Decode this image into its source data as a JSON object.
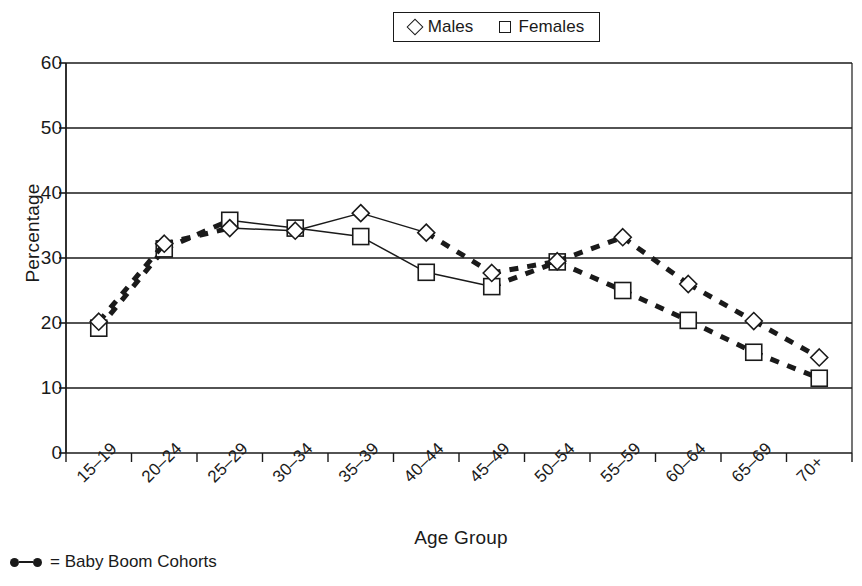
{
  "top_partial_text": "",
  "legend": {
    "position": "top-center",
    "entries": [
      {
        "marker": "diamond-icon",
        "label": "Males"
      },
      {
        "marker": "square-icon",
        "label": "Females"
      }
    ]
  },
  "footnote": {
    "marker": "baby-boom-line-icon",
    "text": "= Baby Boom Cohorts"
  },
  "axis": {
    "ylabel": "Percentage",
    "xlabel": "Age Group"
  },
  "chart_data": {
    "type": "line",
    "title": "",
    "xlabel": "Age Group",
    "ylabel": "Percentage",
    "ylim": [
      0,
      60
    ],
    "ytick_labels": [
      "0",
      "10",
      "20",
      "30",
      "40",
      "50",
      "60"
    ],
    "yticks": [
      0,
      10,
      20,
      30,
      40,
      50,
      60
    ],
    "grid": "horizontal",
    "legend": "top-center",
    "categories": [
      "15–19",
      "20–24",
      "25–29",
      "30–34",
      "35–39",
      "40–44",
      "45–49",
      "50–54",
      "55–59",
      "60–64",
      "65–69",
      "70+"
    ],
    "series": [
      {
        "name": "Males",
        "marker": "diamond",
        "values": [
          20.2,
          32.2,
          34.6,
          34.2,
          36.9,
          33.9,
          27.7,
          29.5,
          33.2,
          26.0,
          20.3,
          14.7
        ]
      },
      {
        "name": "Females",
        "marker": "square",
        "values": [
          19.2,
          31.4,
          35.8,
          34.6,
          33.3,
          27.8,
          25.6,
          29.4,
          25.0,
          20.4,
          15.5,
          11.5
        ]
      }
    ],
    "annotations": [
      {
        "text": "Baby Boom Cohorts shown with thick dashed segments",
        "males_dashed_spans": [
          [
            0,
            2
          ],
          [
            5,
            11
          ]
        ],
        "females_dashed_spans": [
          [
            0,
            2
          ],
          [
            6,
            11
          ]
        ]
      }
    ]
  }
}
